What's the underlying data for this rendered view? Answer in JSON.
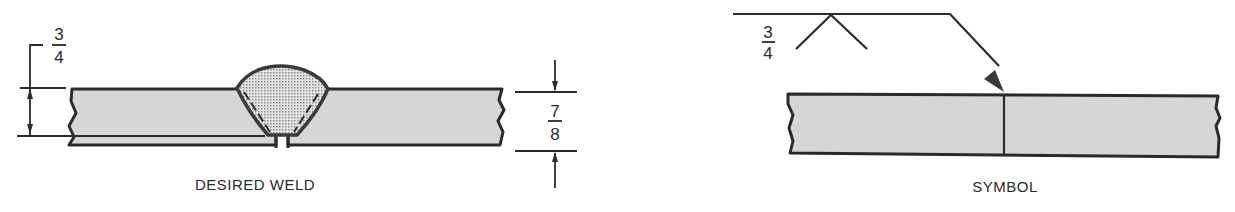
{
  "figure": {
    "colors": {
      "plate_fill": "#d6d6d6",
      "weld_fill": "#c4c4c4",
      "line": "#2a2a2a",
      "background": "#ffffff"
    },
    "left_panel": {
      "caption": "DESIRED WELD",
      "penetration_dimension": {
        "numerator": "3",
        "denominator": "4"
      },
      "thickness_dimension": {
        "numerator": "7",
        "denominator": "8"
      }
    },
    "right_panel": {
      "caption": "SYMBOL",
      "weld_symbol_dimension": {
        "numerator": "3",
        "denominator": "4"
      },
      "symbol_type": "single-V groove weld, arrow side"
    }
  }
}
